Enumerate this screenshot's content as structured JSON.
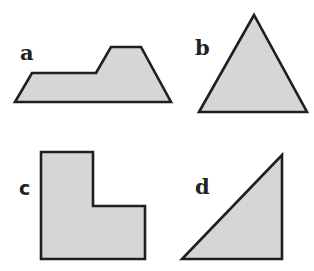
{
  "figure": {
    "colors": {
      "fill": "#d6d6d6",
      "stroke": "#1f1f1f",
      "label": "#222222",
      "background": "#ffffff"
    },
    "shapes": [
      {
        "label": "a",
        "kind": "irregular-hexagon",
        "points": "15,102 32,73 96,73 111,47 141,47 171,102"
      },
      {
        "label": "b",
        "kind": "triangle",
        "points": "254,15 199,112 307,112"
      },
      {
        "label": "c",
        "kind": "l-shape",
        "points": "41,152 93,152 93,206 145,206 145,259 41,259"
      },
      {
        "label": "d",
        "kind": "right-triangle",
        "points": "282,155 282,259 182,259"
      }
    ]
  }
}
